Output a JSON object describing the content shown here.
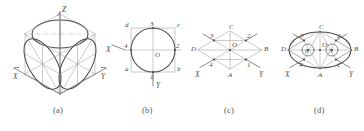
{
  "figure": {
    "background_color": "#ffffff",
    "line_color": "#4a4a4a",
    "thin_line_color": "#9a9a9a",
    "caption_color": "#555555"
  },
  "captions": {
    "a": "(a)",
    "b": "(b)",
    "c": "(c)",
    "d": "(d)"
  },
  "panel_a": {
    "name": "isometric-cube-with-three-ellipses",
    "axes": {
      "x": "X",
      "y": "Y",
      "z": "Z"
    }
  },
  "panel_b": {
    "name": "circle-inscribed-in-square",
    "axes": {
      "x": "X",
      "y": "Y"
    },
    "center": "O",
    "quadrant_points": {
      "top": "3",
      "right": "2",
      "bottom": "1",
      "left": "4"
    },
    "square_corners": {
      "top_left": "d",
      "top_right": "c",
      "bottom_left": "a",
      "bottom_right": "b"
    }
  },
  "panel_c": {
    "name": "isometric-rhombus-construction",
    "axes": {
      "x": "X",
      "y": "Y"
    },
    "center": "O",
    "rhombus_vertices": {
      "top": "C",
      "right": "B",
      "bottom": "A",
      "left": "D"
    },
    "midpoints": {
      "upper_left": "3",
      "upper_right": "2",
      "lower_right": "1",
      "lower_left": "4"
    }
  },
  "panel_d": {
    "name": "four-centre-ellipse-in-rhombus",
    "axes": {
      "x": "X",
      "y": "Y"
    },
    "center": "O",
    "rhombus_vertices": {
      "top": "C",
      "right": "B",
      "bottom": "A",
      "left": "D"
    },
    "tangent_points": {
      "upper_left": "3",
      "upper_right": "2",
      "lower_right": "1",
      "lower_left": "4"
    },
    "arc_centres": {
      "right": "5",
      "left": "6"
    }
  }
}
